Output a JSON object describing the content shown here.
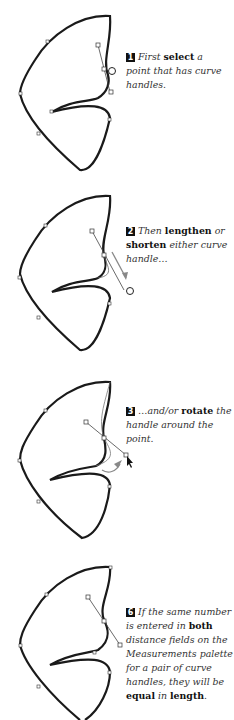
{
  "steps": [
    {
      "number": "1",
      "parts": [
        {
          "text": "First ",
          "bold": false
        },
        {
          "text": "select",
          "bold": true
        },
        {
          "text": " a point that has curve handles.",
          "bold": false
        }
      ]
    },
    {
      "number": "2",
      "parts": [
        {
          "text": "Then ",
          "bold": false
        },
        {
          "text": "lengthen",
          "bold": true
        },
        {
          "text": " or ",
          "bold": false
        },
        {
          "text": "shorten",
          "bold": true
        },
        {
          "text": " either curve handle…",
          "bold": false
        }
      ]
    },
    {
      "number": "3",
      "parts": [
        {
          "text": "…and/or ",
          "bold": false
        },
        {
          "text": "rotate",
          "bold": true
        },
        {
          "text": " the handle around the point.",
          "bold": false
        }
      ]
    },
    {
      "number": "6",
      "parts": [
        {
          "text": "If the same number is entered in ",
          "bold": false
        },
        {
          "text": "both",
          "bold": true
        },
        {
          "text": " distance fields on the Measurements palette for a pair of curve handles, they will be ",
          "bold": false
        },
        {
          "text": "equal",
          "bold": true
        },
        {
          "text": " in ",
          "bold": false
        },
        {
          "text": "length",
          "bold": true
        },
        {
          "text": ".",
          "bold": false
        }
      ]
    }
  ],
  "colors": {
    "stroke": "#1a1a1a",
    "arrow": "#888888",
    "text": "#333333"
  }
}
